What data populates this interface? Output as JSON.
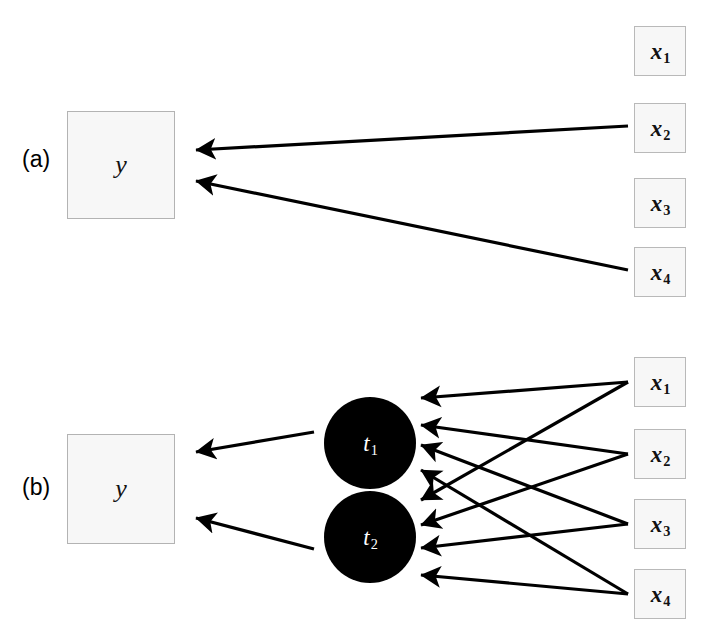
{
  "figure": {
    "type": "diagram",
    "subtype": "directed-graph",
    "background_color": "#ffffff",
    "line_color": "#000000",
    "box_fill": "#f7f7f7",
    "box_border": "#b9b9b9",
    "node_fill": "#000000",
    "node_text_color": "#ffffff"
  },
  "panels": [
    {
      "id": "a",
      "label": "(a)",
      "label_x": 22,
      "label_y": 153,
      "output": {
        "name": "y-box-a",
        "label": "y",
        "x": 67,
        "y": 111,
        "w": 108,
        "h": 108
      },
      "inputs": [
        {
          "name": "x1",
          "base": "x",
          "sub": "1",
          "x": 634,
          "y": 26,
          "w": 52,
          "h": 50
        },
        {
          "name": "x2",
          "base": "x",
          "sub": "2",
          "x": 634,
          "y": 103,
          "w": 52,
          "h": 50
        },
        {
          "name": "x3",
          "base": "x",
          "sub": "3",
          "x": 634,
          "y": 178,
          "w": 52,
          "h": 50
        },
        {
          "name": "x4",
          "base": "x",
          "sub": "4",
          "x": 634,
          "y": 247,
          "w": 52,
          "h": 50
        }
      ],
      "edges": [
        {
          "from": "x2",
          "to": "y",
          "x1": 628,
          "y1": 126,
          "x2": 196,
          "y2": 150
        },
        {
          "from": "x4",
          "to": "y",
          "x1": 628,
          "y1": 270,
          "x2": 196,
          "y2": 181
        }
      ],
      "nodes": []
    },
    {
      "id": "b",
      "label": "(b)",
      "label_x": 22,
      "label_y": 481,
      "output": {
        "name": "y-box-b",
        "label": "y",
        "x": 67,
        "y": 434,
        "w": 108,
        "h": 110
      },
      "inputs": [
        {
          "name": "x1",
          "base": "x",
          "sub": "1",
          "x": 634,
          "y": 357,
          "w": 52,
          "h": 50
        },
        {
          "name": "x2",
          "base": "x",
          "sub": "2",
          "x": 634,
          "y": 429,
          "w": 52,
          "h": 50
        },
        {
          "name": "x3",
          "base": "x",
          "sub": "3",
          "x": 634,
          "y": 499,
          "w": 52,
          "h": 50
        },
        {
          "name": "x4",
          "base": "x",
          "sub": "4",
          "x": 634,
          "y": 569,
          "w": 52,
          "h": 50
        }
      ],
      "nodes": [
        {
          "name": "t1",
          "base": "t",
          "sub": "1",
          "cx": 370,
          "cy": 443,
          "r": 46
        },
        {
          "name": "t2",
          "base": "t",
          "sub": "2",
          "cx": 370,
          "cy": 537,
          "r": 46
        }
      ],
      "edges": [
        {
          "from": "t1",
          "to": "y",
          "x1": 314,
          "y1": 432,
          "x2": 196,
          "y2": 452
        },
        {
          "from": "t2",
          "to": "y",
          "x1": 314,
          "y1": 549,
          "x2": 196,
          "y2": 518
        },
        {
          "from": "x1",
          "to": "t1",
          "x1": 628,
          "y1": 382,
          "x2": 421,
          "y2": 398
        },
        {
          "from": "x1",
          "to": "t2",
          "x1": 628,
          "y1": 382,
          "x2": 421,
          "y2": 500
        },
        {
          "from": "x2",
          "to": "t1",
          "x1": 628,
          "y1": 454,
          "x2": 421,
          "y2": 425
        },
        {
          "from": "x2",
          "to": "t2",
          "x1": 628,
          "y1": 454,
          "x2": 421,
          "y2": 525
        },
        {
          "from": "x3",
          "to": "t1",
          "x1": 628,
          "y1": 524,
          "x2": 421,
          "y2": 445
        },
        {
          "from": "x3",
          "to": "t2",
          "x1": 628,
          "y1": 524,
          "x2": 421,
          "y2": 548
        },
        {
          "from": "x4",
          "to": "t1",
          "x1": 628,
          "y1": 594,
          "x2": 421,
          "y2": 470
        },
        {
          "from": "x4",
          "to": "t2",
          "x1": 628,
          "y1": 594,
          "x2": 421,
          "y2": 575
        }
      ]
    }
  ]
}
